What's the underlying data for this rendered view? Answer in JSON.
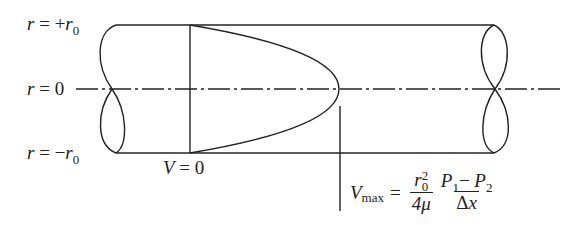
{
  "diagram": {
    "type": "pipe-flow-velocity-profile",
    "labels": {
      "top_wall": {
        "var": "r",
        "eq": "=",
        "sign": "+",
        "sym": "r",
        "sub": "0"
      },
      "centerline": {
        "var": "r",
        "eq": "=",
        "value": "0"
      },
      "bottom_wall": {
        "var": "r",
        "eq": "=",
        "sign": "−",
        "sym": "r",
        "sub": "0"
      },
      "wall_velocity": {
        "var": "V",
        "eq": "=",
        "value": "0"
      },
      "vmax": {
        "var": "V",
        "sub": "max",
        "eq": "=",
        "frac1_num_sym": "r",
        "frac1_num_sup": "2",
        "frac1_num_sub": "0",
        "frac1_den": "4μ",
        "frac2_num_p1": "P",
        "frac2_num_p1_sub": "1",
        "frac2_num_minus": "−",
        "frac2_num_p2": "P",
        "frac2_num_p2_sub": "2",
        "frac2_den_delta": "Δ",
        "frac2_den_x": "x"
      }
    },
    "colors": {
      "line": "#222222",
      "background": "#ffffff"
    }
  }
}
